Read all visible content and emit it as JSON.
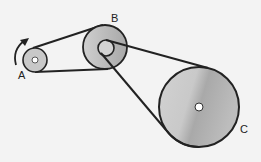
{
  "diagram": {
    "title": "",
    "labels": {
      "a": "A",
      "b": "B",
      "c": "C"
    },
    "pulleys": [
      {
        "id": "A",
        "cx": 35,
        "cy": 60,
        "r": 12
      },
      {
        "id": "B",
        "cx": 105,
        "cy": 47,
        "r": 22,
        "inner_r": 8
      },
      {
        "id": "C",
        "cx": 199,
        "cy": 107,
        "r": 40
      }
    ],
    "rotation_arrow": "counterclockwise",
    "colors": {
      "belt": "#222222",
      "pulley_fill": "#c4c4c4",
      "background": "#f3f3f3"
    }
  }
}
